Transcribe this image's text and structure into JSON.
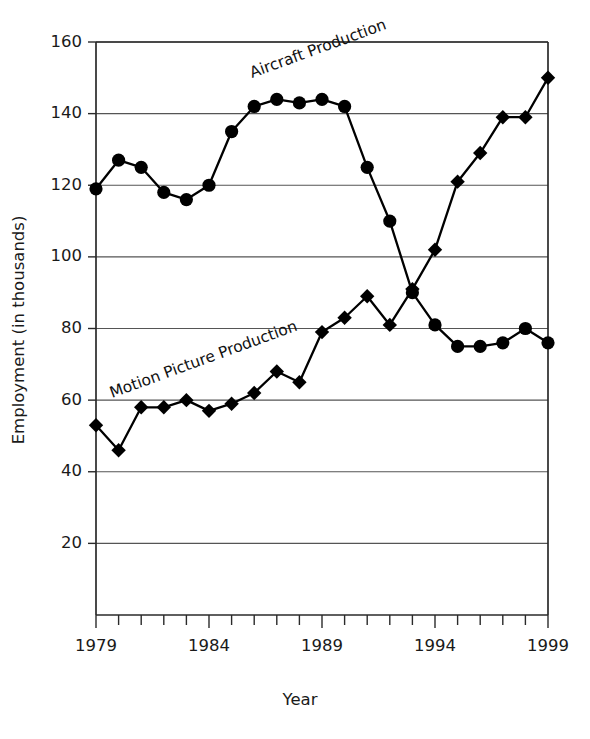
{
  "chart_data": {
    "type": "line",
    "title": "",
    "xlabel": "Year",
    "ylabel": "Employment (in thousands)",
    "x": [
      1979,
      1980,
      1981,
      1982,
      1983,
      1984,
      1985,
      1986,
      1987,
      1988,
      1989,
      1990,
      1991,
      1992,
      1993,
      1994,
      1995,
      1996,
      1997,
      1998,
      1999
    ],
    "xlim": [
      1979,
      1999
    ],
    "ylim": [
      0,
      160
    ],
    "yticks": [
      20,
      40,
      60,
      80,
      100,
      120,
      140,
      160
    ],
    "ytick_labels": [
      "20",
      "40",
      "60",
      "80",
      "100",
      "120",
      "140",
      "160"
    ],
    "xticks": [
      1979,
      1980,
      1981,
      1982,
      1983,
      1984,
      1985,
      1986,
      1987,
      1988,
      1989,
      1990,
      1991,
      1992,
      1993,
      1994,
      1995,
      1996,
      1997,
      1998,
      1999
    ],
    "xtick_labels": [
      "1979",
      "",
      "",
      "",
      "",
      "1984",
      "",
      "",
      "",
      "",
      "1989",
      "",
      "",
      "",
      "",
      "1994",
      "",
      "",
      "",
      "",
      "1999"
    ],
    "grid": "horizontal",
    "legend_position": "inline-annotation",
    "series": [
      {
        "name": "Aircraft Production",
        "marker": "circle",
        "color": "#000000",
        "values": [
          119,
          127,
          125,
          118,
          116,
          120,
          135,
          142,
          144,
          143,
          144,
          142,
          125,
          110,
          90,
          81,
          75,
          75,
          76,
          80,
          76
        ],
        "label_text": "Aircraft Production",
        "label_rotation": -20
      },
      {
        "name": "Motion Picture Production",
        "marker": "diamond",
        "color": "#000000",
        "values": [
          53,
          46,
          58,
          58,
          60,
          57,
          59,
          62,
          68,
          65,
          79,
          83,
          89,
          81,
          91,
          102,
          121,
          129,
          139,
          139,
          150
        ],
        "label_text": "Motion Picture Production",
        "label_rotation": -20
      }
    ]
  },
  "axis_titles": {
    "y": "Employment (in thousands)",
    "x": "Year"
  }
}
